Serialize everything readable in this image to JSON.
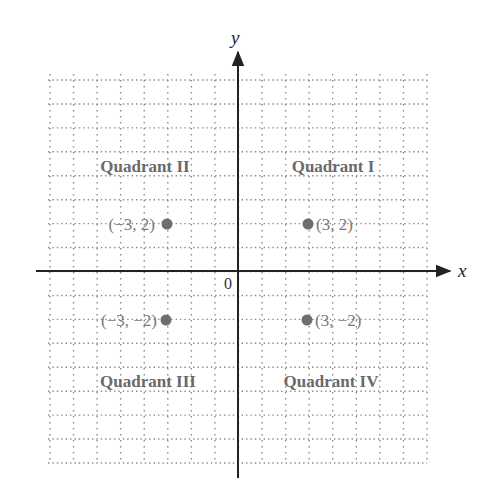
{
  "diagram": {
    "type": "coordinate-plane",
    "axes": {
      "x_label": "x",
      "y_label": "y",
      "origin_label": "0",
      "x_range": [
        -8,
        8
      ],
      "y_range": [
        -8,
        8
      ],
      "grid": "dotted",
      "grid_step": 1
    },
    "quadrants": [
      {
        "id": "I",
        "label": "Quadrant I"
      },
      {
        "id": "II",
        "label": "Quadrant II"
      },
      {
        "id": "III",
        "label": "Quadrant III"
      },
      {
        "id": "IV",
        "label": "Quadrant IV"
      }
    ],
    "points": [
      {
        "x": -3,
        "y": 2,
        "label": "(−3, 2)",
        "label_side": "left"
      },
      {
        "x": 3,
        "y": 2,
        "label": "(3, 2)",
        "label_side": "right"
      },
      {
        "x": -3,
        "y": -2,
        "label": "(−3, −2)",
        "label_side": "left"
      },
      {
        "x": 3,
        "y": -2,
        "label": "(3, −2)",
        "label_side": "right"
      }
    ],
    "colors": {
      "axis": "#222222",
      "grid": "#8a8a8a",
      "point": "#6e6e6e",
      "quadrant_text": "#6a6a6a",
      "point_text": "#7a7a7a"
    }
  }
}
